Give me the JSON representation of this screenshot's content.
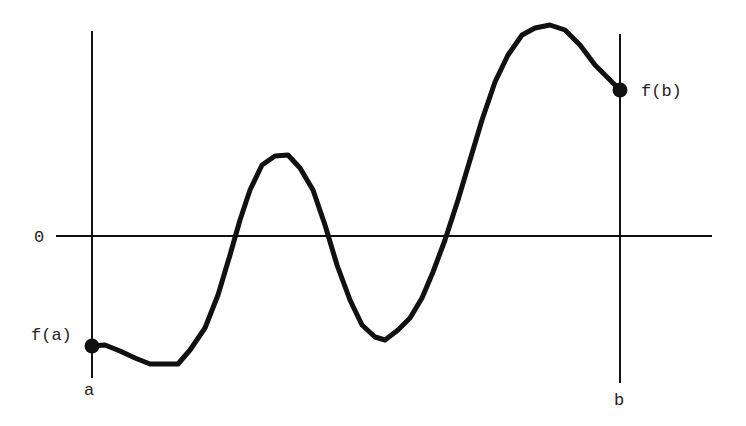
{
  "diagram": {
    "type": "function-graph",
    "labels": {
      "zero": "0",
      "fa": "f(a)",
      "fb": "f(b)",
      "a": "a",
      "b": "b"
    },
    "colors": {
      "stroke": "#111111",
      "axis": "#111111",
      "text": "#222222",
      "background": "#ffffff"
    },
    "curve_points": [
      [
        92,
        346
      ],
      [
        105,
        345
      ],
      [
        120,
        351
      ],
      [
        135,
        358
      ],
      [
        150,
        364
      ],
      [
        165,
        364
      ],
      [
        178,
        364
      ],
      [
        190,
        350
      ],
      [
        205,
        328
      ],
      [
        218,
        295
      ],
      [
        230,
        255
      ],
      [
        240,
        220
      ],
      [
        250,
        190
      ],
      [
        262,
        165
      ],
      [
        275,
        156
      ],
      [
        288,
        155
      ],
      [
        300,
        168
      ],
      [
        313,
        190
      ],
      [
        325,
        225
      ],
      [
        337,
        265
      ],
      [
        350,
        300
      ],
      [
        362,
        325
      ],
      [
        375,
        337
      ],
      [
        385,
        340
      ],
      [
        398,
        330
      ],
      [
        410,
        318
      ],
      [
        422,
        298
      ],
      [
        433,
        272
      ],
      [
        445,
        240
      ],
      [
        458,
        200
      ],
      [
        470,
        160
      ],
      [
        482,
        120
      ],
      [
        495,
        82
      ],
      [
        508,
        55
      ],
      [
        522,
        35
      ],
      [
        535,
        28
      ],
      [
        550,
        25
      ],
      [
        565,
        30
      ],
      [
        580,
        45
      ],
      [
        595,
        65
      ],
      [
        608,
        78
      ],
      [
        620,
        90
      ]
    ],
    "axes": {
      "x_axis": {
        "x1": 56,
        "x2": 712,
        "y": 236
      },
      "left_line": {
        "x": 92,
        "y1": 31,
        "y2": 378
      },
      "right_line": {
        "x": 620,
        "y1": 34,
        "y2": 383
      }
    },
    "points": [
      {
        "name": "fa",
        "cx": 92,
        "cy": 346
      },
      {
        "name": "fb",
        "cx": 620,
        "cy": 90
      }
    ]
  }
}
